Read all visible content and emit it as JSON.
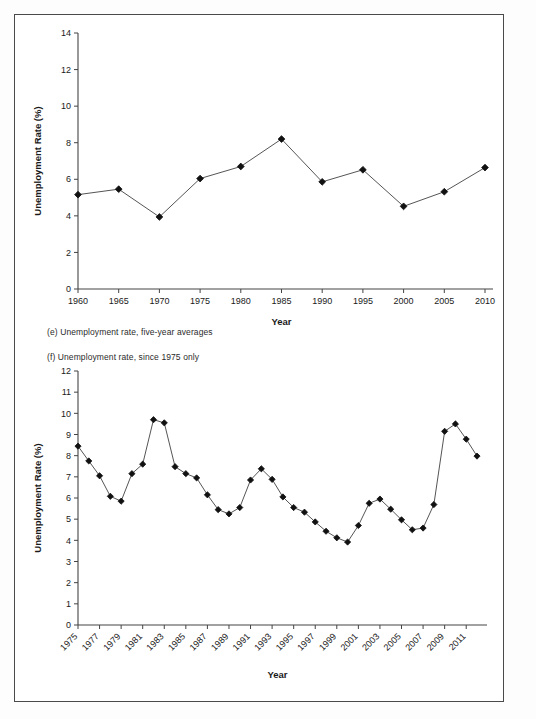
{
  "page": {
    "background": "#ffffff",
    "frame_color": "#4a4a4a",
    "line_color": "#555555",
    "marker_color": "#111111"
  },
  "captions": {
    "e": "(e) Unemployment rate, five-year averages",
    "f": "(f) Unemployment rate, since 1975 only"
  },
  "chart_data": [
    {
      "id": "chart-e",
      "type": "line",
      "title": "",
      "xlabel": "Year",
      "ylabel": "Unemployment Rate (%)",
      "xlim": [
        1960,
        2010
      ],
      "ylim": [
        0,
        14
      ],
      "yticks": [
        0,
        2,
        4,
        6,
        8,
        10,
        12,
        14
      ],
      "xticks": [
        1960,
        1965,
        1970,
        1975,
        1980,
        1985,
        1990,
        1995,
        2000,
        2005,
        2010
      ],
      "xtick_labels": [
        "1960",
        "1965",
        "1970",
        "1975",
        "1980",
        "1985",
        "1990",
        "1995",
        "2000",
        "2005",
        "2010"
      ],
      "ytick_labels": [
        "0",
        "2",
        "4",
        "6",
        "8",
        "10",
        "12",
        "14"
      ],
      "grid": false,
      "legend": null,
      "marker": "diamond",
      "x": [
        1960,
        1965,
        1970,
        1975,
        1980,
        1985,
        1990,
        1995,
        2000,
        2005,
        2010
      ],
      "values": [
        5.16,
        5.46,
        3.94,
        6.04,
        6.7,
        8.2,
        5.86,
        6.52,
        4.52,
        5.32,
        6.64
      ]
    },
    {
      "id": "chart-f",
      "type": "line",
      "title": "",
      "xlabel": "Year",
      "ylabel": "Unemployment Rate (%)",
      "xlim": [
        1975,
        2012
      ],
      "ylim": [
        0,
        12
      ],
      "yticks": [
        0,
        1,
        2,
        3,
        4,
        5,
        6,
        7,
        8,
        9,
        10,
        11,
        12
      ],
      "ytick_labels": [
        "0",
        "1",
        "2",
        "3",
        "4",
        "5",
        "6",
        "7",
        "8",
        "9",
        "10",
        "11",
        "12"
      ],
      "xticks": [
        1975,
        1977,
        1979,
        1981,
        1983,
        1985,
        1987,
        1989,
        1991,
        1993,
        1995,
        1997,
        1999,
        2001,
        2003,
        2005,
        2007,
        2009,
        2011
      ],
      "xtick_labels": [
        "1975",
        "1977",
        "1979",
        "1981",
        "1983",
        "1985",
        "1987",
        "1989",
        "1991",
        "1993",
        "1995",
        "1997",
        "1999",
        "2001",
        "2003",
        "2005",
        "2007",
        "2009",
        "2011"
      ],
      "xtick_rotation": 45,
      "grid": false,
      "legend": null,
      "marker": "diamond",
      "x": [
        1975,
        1976,
        1977,
        1978,
        1979,
        1980,
        1981,
        1982,
        1983,
        1984,
        1985,
        1986,
        1987,
        1988,
        1989,
        1990,
        1991,
        1992,
        1993,
        1994,
        1995,
        1996,
        1997,
        1998,
        1999,
        2000,
        2001,
        2002,
        2003,
        2004,
        2005,
        2006,
        2007,
        2008,
        2009,
        2010,
        2011,
        2012
      ],
      "values": [
        8.45,
        7.75,
        7.05,
        6.08,
        5.85,
        7.15,
        7.6,
        9.7,
        9.55,
        7.48,
        7.15,
        6.95,
        6.15,
        5.45,
        5.25,
        5.55,
        6.85,
        7.38,
        6.88,
        6.05,
        5.55,
        5.33,
        4.87,
        4.43,
        4.12,
        3.92,
        4.7,
        5.75,
        5.95,
        5.47,
        4.97,
        4.5,
        4.58,
        5.69,
        9.15,
        9.5,
        8.78,
        7.98
      ]
    }
  ]
}
